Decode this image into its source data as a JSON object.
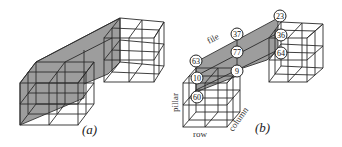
{
  "figure": {
    "panels": [
      {
        "id": "a",
        "caption": "(a)",
        "description": "Two 2x2x2 wireframe cube grids connected by a shaded plane"
      },
      {
        "id": "b",
        "caption": "(b)",
        "labels": {
          "file": "file",
          "pillar": "pillar",
          "row": "row",
          "column": "column"
        },
        "nodes": [
          {
            "value": "63"
          },
          {
            "value": "10"
          },
          {
            "value": "60"
          },
          {
            "value": "37"
          },
          {
            "value": "77"
          },
          {
            "value": "9"
          },
          {
            "value": "23"
          },
          {
            "value": "36"
          },
          {
            "value": "64"
          }
        ]
      }
    ],
    "colors": {
      "plane_fill": "#8c8c8c",
      "edge": "#2a2a2a",
      "background": "#ffffff"
    }
  }
}
